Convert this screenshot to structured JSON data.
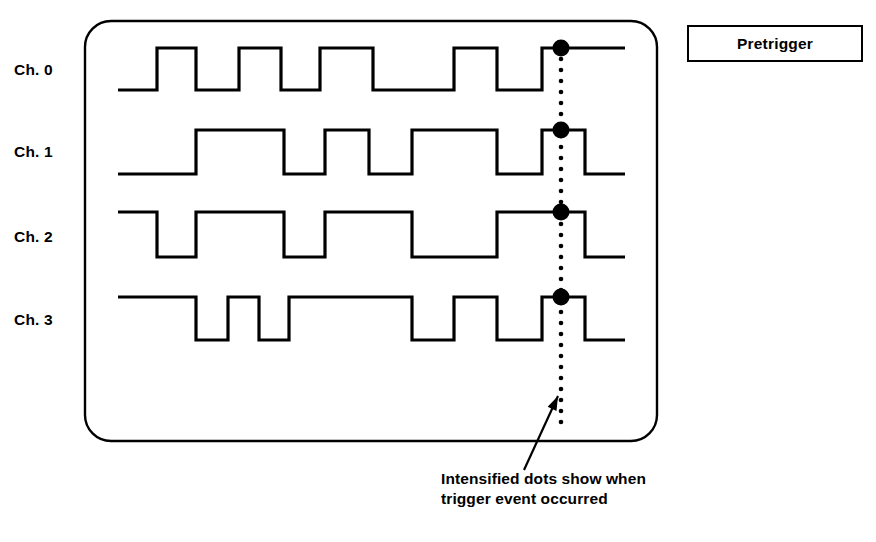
{
  "figure": {
    "title_box": {
      "label": "Pretrigger"
    },
    "caption": {
      "line1": "Intensified dots show when",
      "line2": "trigger event occurred"
    },
    "screen": {
      "name": "logic-analyzer-screen",
      "shape": "rounded-rectangle",
      "x": 85,
      "y": 21,
      "width": 572,
      "height": 420,
      "corner_radius": 26,
      "stroke_color": "#000000",
      "stroke_width": 2.4,
      "fill_color": "#ffffff"
    },
    "channels": [
      {
        "id": "ch0",
        "label": "Ch. 0",
        "label_y": 70
      },
      {
        "id": "ch1",
        "label": "Ch. 1",
        "label_y": 152
      },
      {
        "id": "ch2",
        "label": "Ch. 2",
        "label_y": 238
      },
      {
        "id": "ch3",
        "label": "Ch. 3",
        "label_y": 320
      }
    ],
    "trigger_marker": {
      "name": "trigger-dotted-line",
      "x": 561,
      "y_top": 48,
      "y_bottom": 430,
      "dot_radius": 2.3,
      "dot_spacing": 11,
      "color": "#000000",
      "intensified_dot_radius": 8.5,
      "intensified_dot_y": [
        48,
        130,
        212,
        297
      ]
    },
    "callout_arrow": {
      "name": "caption-callout-arrow",
      "from_x": 524,
      "from_y": 470,
      "to_x": 558,
      "to_y": 396,
      "stroke_width": 2.2,
      "color": "#000000"
    },
    "waveform_style": {
      "stroke_color": "#000000",
      "stroke_width": 3.2
    }
  },
  "chart_data": {
    "type": "line",
    "title": "Pretrigger",
    "subtitle": "Intensified dots show when trigger event occurred",
    "xlabel": "",
    "ylabel": "",
    "x_range": [
      118,
      625
    ],
    "grid": false,
    "legend": "none",
    "trigger_x": 561,
    "series": [
      {
        "name": "Ch. 0",
        "y_high": 48,
        "y_low": 90,
        "x_start": 118,
        "x_end": 625,
        "transitions": [
          {
            "x": 118,
            "level": 0
          },
          {
            "x": 157,
            "level": 1
          },
          {
            "x": 196,
            "level": 0
          },
          {
            "x": 239,
            "level": 1
          },
          {
            "x": 281,
            "level": 0
          },
          {
            "x": 320,
            "level": 1
          },
          {
            "x": 373,
            "level": 0
          },
          {
            "x": 454,
            "level": 1
          },
          {
            "x": 497,
            "level": 0
          },
          {
            "x": 542,
            "level": 1
          },
          {
            "x": 625,
            "level": 1
          }
        ]
      },
      {
        "name": "Ch. 1",
        "y_high": 130,
        "y_low": 174,
        "x_start": 118,
        "x_end": 625,
        "transitions": [
          {
            "x": 118,
            "level": 0
          },
          {
            "x": 196,
            "level": 1
          },
          {
            "x": 284,
            "level": 0
          },
          {
            "x": 325,
            "level": 1
          },
          {
            "x": 369,
            "level": 0
          },
          {
            "x": 412,
            "level": 1
          },
          {
            "x": 497,
            "level": 0
          },
          {
            "x": 542,
            "level": 1
          },
          {
            "x": 585,
            "level": 0
          },
          {
            "x": 625,
            "level": 0
          }
        ]
      },
      {
        "name": "Ch. 2",
        "y_high": 212,
        "y_low": 257,
        "x_start": 118,
        "x_end": 625,
        "transitions": [
          {
            "x": 118,
            "level": 1
          },
          {
            "x": 157,
            "level": 0
          },
          {
            "x": 196,
            "level": 1
          },
          {
            "x": 284,
            "level": 0
          },
          {
            "x": 325,
            "level": 1
          },
          {
            "x": 412,
            "level": 0
          },
          {
            "x": 497,
            "level": 1
          },
          {
            "x": 585,
            "level": 0
          },
          {
            "x": 625,
            "level": 0
          }
        ]
      },
      {
        "name": "Ch. 3",
        "y_high": 297,
        "y_low": 340,
        "x_start": 118,
        "x_end": 625,
        "transitions": [
          {
            "x": 118,
            "level": 1
          },
          {
            "x": 196,
            "level": 0
          },
          {
            "x": 228,
            "level": 1
          },
          {
            "x": 259,
            "level": 0
          },
          {
            "x": 289,
            "level": 1
          },
          {
            "x": 412,
            "level": 0
          },
          {
            "x": 454,
            "level": 1
          },
          {
            "x": 497,
            "level": 0
          },
          {
            "x": 542,
            "level": 1
          },
          {
            "x": 585,
            "level": 0
          },
          {
            "x": 625,
            "level": 0
          }
        ]
      }
    ]
  }
}
